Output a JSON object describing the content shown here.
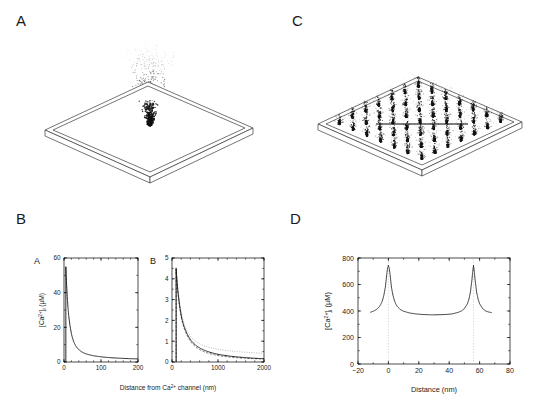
{
  "figure": {
    "panels": [
      {
        "id": "A",
        "letter": "A",
        "type": "3d-scatter-plane",
        "desc": "single Ca2+ channel plume on membrane plane"
      },
      {
        "id": "C",
        "letter": "C",
        "type": "3d-scatter-plane",
        "desc": "array of Ca2+ channel plumes on membrane plane"
      },
      {
        "id": "B",
        "letter": "B",
        "type": "line-pair",
        "desc": "two concentration-distance subplots"
      },
      {
        "id": "D",
        "letter": "D",
        "type": "line",
        "desc": "concentration profile between two channels"
      }
    ]
  },
  "panelA": {
    "letter": "A",
    "plume": {
      "center_x": 155,
      "base_y": 108,
      "n_points": 620,
      "spread": 46,
      "height": 72
    }
  },
  "panelC": {
    "letter": "C",
    "grid": {
      "rows": 7,
      "cols": 7,
      "n_points_per_plume": 38
    },
    "reference_line": {
      "label": "channel-spacing-line"
    }
  },
  "panelB": {
    "letter": "B",
    "shared_xlabel": "Distance from Ca2+ channel (nm)",
    "shared_xlabel_parts": {
      "pre": "Distance from Ca",
      "sup": "2+",
      "post": " channel (nm)"
    },
    "subplots": [
      {
        "letter": "A",
        "ylabel_parts": {
          "pre": "[Ca",
          "sup": "2+",
          "sub": "i",
          "post": " (",
          "unit": "µM",
          "close": ")"
        },
        "ylabel": "[Ca2+]i (µM)",
        "xticks": [
          0,
          100,
          200
        ],
        "xtick_labels": [
          "0",
          "100",
          "200"
        ],
        "yticks": [
          0,
          20,
          40,
          60
        ],
        "ytick_labels": [
          "0",
          "20",
          "40",
          "60"
        ],
        "xlim": [
          0,
          200
        ],
        "ylim": [
          0,
          60
        ]
      },
      {
        "letter": "B",
        "xticks": [
          0,
          1000,
          2000
        ],
        "xtick_labels": [
          "0",
          "1000",
          "2000"
        ],
        "yticks": [
          0,
          1,
          2,
          3,
          4,
          5
        ],
        "ytick_labels": [
          "0",
          "1",
          "2",
          "3",
          "4",
          "5"
        ],
        "xlim": [
          0,
          2000
        ],
        "ylim": [
          0,
          5
        ]
      }
    ]
  },
  "panelD": {
    "letter": "D",
    "xlabel": "Distance (nm)",
    "ylabel": "[Ca2+]i (µM)",
    "ylabel_parts": {
      "pre": "[Ca",
      "sup": "2+",
      "sub": "i",
      "post": " (",
      "unit": "µM",
      "close": ")"
    },
    "xticks": [
      -20,
      0,
      20,
      40,
      60,
      80
    ],
    "xtick_labels": [
      "−20",
      "0",
      "20",
      "40",
      "60",
      "80"
    ],
    "yticks": [
      0,
      200,
      400,
      600,
      800
    ],
    "ytick_labels": [
      "0",
      "200",
      "400",
      "600",
      "800"
    ],
    "xlim": [
      -20,
      80
    ],
    "ylim": [
      0,
      800
    ],
    "guides_at_x": [
      0,
      56
    ]
  },
  "chart_data": [
    {
      "id": "panelB-subplotA",
      "type": "line",
      "title": "A",
      "xlabel": "Distance from Ca2+ channel (nm)",
      "ylabel": "[Ca2+]i (µM)",
      "xlim": [
        0,
        200
      ],
      "ylim": [
        0,
        60
      ],
      "xticks": [
        0,
        100,
        200
      ],
      "yticks": [
        0,
        20,
        40,
        60
      ],
      "grid": false,
      "legend": "none",
      "series": [
        {
          "name": "free Ca2+ concentration",
          "style": "solid",
          "x": [
            5,
            8,
            10,
            12,
            15,
            20,
            25,
            30,
            35,
            40,
            50,
            60,
            70,
            80,
            90,
            100,
            120,
            140,
            160,
            180,
            200
          ],
          "y": [
            55.0,
            41.0,
            34.0,
            28.5,
            23.0,
            16.5,
            12.5,
            10.0,
            8.3,
            7.2,
            5.6,
            4.7,
            4.1,
            3.6,
            3.3,
            3.0,
            2.6,
            2.3,
            2.1,
            1.9,
            1.8
          ]
        }
      ]
    },
    {
      "id": "panelB-subplotB",
      "type": "line",
      "title": "B",
      "xlabel": "Distance from Ca2+ channel (nm)",
      "ylabel": "[Ca2+]i (µM)",
      "xlim": [
        0,
        2000
      ],
      "ylim": [
        0,
        5
      ],
      "xticks": [
        0,
        1000,
        2000
      ],
      "yticks": [
        0,
        1,
        2,
        3,
        4,
        5
      ],
      "grid": false,
      "legend": "none",
      "series": [
        {
          "name": "solid trace",
          "style": "solid",
          "x": [
            90,
            120,
            150,
            200,
            250,
            300,
            400,
            500,
            600,
            700,
            800,
            1000,
            1200,
            1400,
            1600,
            1800,
            2000
          ],
          "y": [
            4.5,
            3.6,
            3.0,
            2.25,
            1.8,
            1.5,
            1.08,
            0.84,
            0.68,
            0.57,
            0.49,
            0.37,
            0.3,
            0.25,
            0.21,
            0.18,
            0.16
          ]
        },
        {
          "name": "dashed trace",
          "style": "dashed",
          "x": [
            90,
            120,
            150,
            200,
            250,
            300,
            400,
            500,
            600,
            700,
            800,
            1000,
            1200,
            1400,
            1600,
            1800,
            2000
          ],
          "y": [
            4.45,
            3.55,
            2.95,
            2.18,
            1.72,
            1.42,
            1.0,
            0.76,
            0.6,
            0.49,
            0.42,
            0.31,
            0.25,
            0.21,
            0.18,
            0.16,
            0.14
          ]
        },
        {
          "name": "dotted trace",
          "style": "dotted",
          "x": [
            90,
            120,
            150,
            200,
            250,
            300,
            400,
            500,
            600,
            700,
            800,
            1000,
            1200,
            1400,
            1600,
            1800,
            2000
          ],
          "y": [
            4.55,
            3.7,
            3.12,
            2.4,
            1.96,
            1.66,
            1.25,
            1.02,
            0.88,
            0.78,
            0.71,
            0.61,
            0.55,
            0.5,
            0.47,
            0.44,
            0.42
          ]
        }
      ]
    },
    {
      "id": "panelD",
      "type": "line",
      "title": "",
      "xlabel": "Distance (nm)",
      "ylabel": "[Ca2+]i (µM)",
      "xlim": [
        -20,
        80
      ],
      "ylim": [
        0,
        800
      ],
      "xticks": [
        -20,
        0,
        20,
        40,
        60,
        80
      ],
      "yticks": [
        0,
        200,
        400,
        600,
        800
      ],
      "grid": false,
      "legend": "none",
      "annotations": [
        {
          "type": "vline",
          "x": 0,
          "style": "dotted"
        },
        {
          "type": "vline",
          "x": 56,
          "style": "dotted"
        }
      ],
      "series": [
        {
          "name": "Ca2+ profile between two channels",
          "style": "solid",
          "peaks_at_x": [
            0,
            56
          ],
          "peak_value": 740,
          "plateau_value": 375,
          "x": [
            -12,
            -10,
            -8,
            -6,
            -5,
            -4,
            -3,
            -2,
            -1.2,
            -0.6,
            0,
            0.6,
            1.2,
            2,
            3,
            4,
            5,
            6,
            8,
            10,
            14,
            18,
            22,
            26,
            28,
            30,
            34,
            38,
            42,
            46,
            48,
            50,
            52,
            53,
            54,
            55,
            55.4,
            56,
            56.6,
            57,
            58,
            59,
            60,
            62,
            64,
            66,
            68
          ],
          "y": [
            390,
            398,
            410,
            432,
            450,
            476,
            518,
            580,
            665,
            720,
            745,
            720,
            665,
            580,
            518,
            476,
            450,
            432,
            410,
            398,
            385,
            378,
            374,
            372,
            371,
            371,
            372,
            374,
            378,
            390,
            400,
            418,
            455,
            490,
            545,
            640,
            690,
            745,
            690,
            640,
            545,
            490,
            455,
            418,
            400,
            392,
            388
          ]
        }
      ]
    }
  ]
}
